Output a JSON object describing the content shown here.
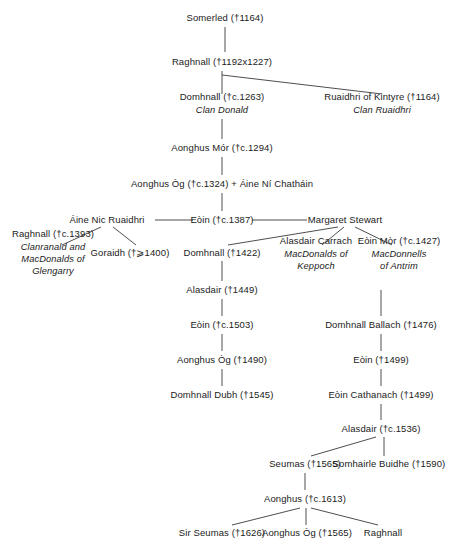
{
  "diagram": {
    "type": "family-tree",
    "background_color": "#ffffff",
    "text_color": "#1b1b1b",
    "line_color": "#3a3a3a",
    "nodes": [
      {
        "id": "somerled",
        "name": "Somerled (†1164)",
        "sub": "",
        "x": 225,
        "y": 18
      },
      {
        "id": "raghnall1",
        "name": "Raghnall (†1192x1227)",
        "sub": "",
        "x": 222,
        "y": 62
      },
      {
        "id": "domhnall1",
        "name": "Domhnall (†c.1263)",
        "sub": "Clan Donald",
        "x": 222,
        "y": 103
      },
      {
        "id": "ruaidhri-kintyre",
        "name": "Ruaidhri of Kintyre (†1164)",
        "sub": "Clan Ruaidhri",
        "x": 382,
        "y": 103
      },
      {
        "id": "aonghus-mor",
        "name": "Aonghus Mór (†c.1294)",
        "sub": "",
        "x": 222,
        "y": 148
      },
      {
        "id": "aonghus-og1",
        "name": "Aonghus Òg (†c.1324) + Áine Ní Chatháin",
        "sub": "",
        "x": 222,
        "y": 184
      },
      {
        "id": "aine-nic",
        "name": "Áine Nic Ruaidhri",
        "sub": "",
        "x": 107,
        "y": 220
      },
      {
        "id": "eoin1387",
        "name": "Eòin (†c.1387)",
        "sub": "",
        "x": 222,
        "y": 220
      },
      {
        "id": "margaret",
        "name": "Margaret Stewart",
        "sub": "",
        "x": 345,
        "y": 220
      },
      {
        "id": "raghnall1393",
        "name": "Raghnall (†c.1393)",
        "sub": "Clanranald and\nMacDonalds of\nGlengarry",
        "x": 53,
        "y": 253
      },
      {
        "id": "goraidh",
        "name": "Goraidh (†⩾1400)",
        "sub": "",
        "x": 130,
        "y": 253
      },
      {
        "id": "domhnall1422",
        "name": "Domhnall (†1422)",
        "sub": "",
        "x": 222,
        "y": 253
      },
      {
        "id": "alasdair-carrach",
        "name": "Alasdair Carrach",
        "sub": "MacDonalds of\nKeppoch",
        "x": 316,
        "y": 253
      },
      {
        "id": "eoin-mor",
        "name": "Eòin Mòr (†c.1427)",
        "sub": "MacDonnells\nof Antrim",
        "x": 399,
        "y": 253
      },
      {
        "id": "alasdair1449",
        "name": "Alasdair (†1449)",
        "sub": "",
        "x": 222,
        "y": 290
      },
      {
        "id": "eoin1503",
        "name": "Eòin (†c.1503)",
        "sub": "",
        "x": 222,
        "y": 325
      },
      {
        "id": "aonghus-og1490",
        "name": "Aonghus Òg (†1490)",
        "sub": "",
        "x": 222,
        "y": 360
      },
      {
        "id": "domhnall-dubh",
        "name": "Domhnall Dubh (†1545)",
        "sub": "",
        "x": 222,
        "y": 395
      },
      {
        "id": "domhnall-ballach",
        "name": "Domhnall Ballach (†1476)",
        "sub": "",
        "x": 381,
        "y": 325
      },
      {
        "id": "eoin1499",
        "name": "Eòin (†1499)",
        "sub": "",
        "x": 381,
        "y": 360
      },
      {
        "id": "eoin-cathanach",
        "name": "Eòin Cathanach (†1499)",
        "sub": "",
        "x": 381,
        "y": 395
      },
      {
        "id": "alasdair1536",
        "name": "Alasdair (†c.1536)",
        "sub": "",
        "x": 381,
        "y": 429
      },
      {
        "id": "seumas1565",
        "name": "Seumas (†1565)",
        "sub": "",
        "x": 305,
        "y": 464
      },
      {
        "id": "somhairle",
        "name": "Somhairle Buidhe (†1590)",
        "sub": "",
        "x": 389,
        "y": 464
      },
      {
        "id": "aonghus1613",
        "name": "Aonghus (†c.1613)",
        "sub": "",
        "x": 305,
        "y": 499
      },
      {
        "id": "sir-seumas",
        "name": "Sir Seumas (†1626)",
        "sub": "",
        "x": 222,
        "y": 533
      },
      {
        "id": "aonghus-og1565",
        "name": "Aonghus Òg (†1565)",
        "sub": "",
        "x": 307,
        "y": 533
      },
      {
        "id": "raghnall-last",
        "name": "Raghnall",
        "sub": "",
        "x": 383,
        "y": 533
      }
    ],
    "edges": [
      {
        "from": "somerled",
        "to": "raghnall1",
        "points": "225,27 225,52"
      },
      {
        "from": "raghnall1",
        "to": "domhnall1",
        "points": "222,71 222,94"
      },
      {
        "from": "raghnall1",
        "to": "ruaidhri-kintyre",
        "points": "222,75 382,94"
      },
      {
        "from": "domhnall1",
        "to": "aonghus-mor",
        "points": "222,119 222,139"
      },
      {
        "from": "aonghus-mor",
        "to": "aonghus-og1",
        "points": "222,157 222,175"
      },
      {
        "from": "aonghus-og1",
        "to": "eoin1387",
        "points": "222,193 222,211"
      },
      {
        "from": "eoin1387",
        "to": "aine-nic",
        "points": "155,220 193,220"
      },
      {
        "from": "eoin1387",
        "to": "margaret",
        "points": "252,220 307,220"
      },
      {
        "from": "aine-nic",
        "to": "raghnall1393",
        "points": "101,227 62,245"
      },
      {
        "from": "aine-nic",
        "to": "goraidh",
        "points": "113,227 136,245"
      },
      {
        "from": "margaret",
        "to": "domhnall1422",
        "points": "338,227 228,245"
      },
      {
        "from": "margaret",
        "to": "alasdair-carrach",
        "points": "344,227 322,245"
      },
      {
        "from": "margaret",
        "to": "eoin-mor",
        "points": "355,227 392,245"
      },
      {
        "from": "domhnall1422",
        "to": "alasdair1449",
        "points": "222,261 222,281"
      },
      {
        "from": "alasdair1449",
        "to": "eoin1503",
        "points": "222,299 222,316"
      },
      {
        "from": "eoin1503",
        "to": "aonghus-og1490",
        "points": "222,334 222,351"
      },
      {
        "from": "aonghus-og1490",
        "to": "domhnall-dubh",
        "points": "222,369 222,386"
      },
      {
        "from": "eoin-mor",
        "to": "domhnall-ballach",
        "points": "381,290 381,316"
      },
      {
        "from": "domhnall-ballach",
        "to": "eoin1499",
        "points": "381,334 381,351"
      },
      {
        "from": "eoin1499",
        "to": "eoin-cathanach",
        "points": "381,369 381,386"
      },
      {
        "from": "eoin-cathanach",
        "to": "alasdair1536",
        "points": "381,404 381,420"
      },
      {
        "from": "alasdair1536",
        "to": "seumas1565",
        "points": "376,437 311,456"
      },
      {
        "from": "alasdair1536",
        "to": "somhairle",
        "points": "384,437 384,456"
      },
      {
        "from": "seumas1565",
        "to": "aonghus1613",
        "points": "305,473 305,490"
      },
      {
        "from": "aonghus1613",
        "to": "sir-seumas",
        "points": "300,508 232,525"
      },
      {
        "from": "aonghus1613",
        "to": "aonghus-og1565",
        "points": "306,508 306,525"
      },
      {
        "from": "aonghus1613",
        "to": "raghnall-last",
        "points": "311,508 378,525"
      }
    ]
  }
}
